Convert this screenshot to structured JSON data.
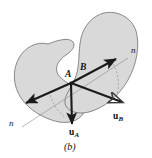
{
  "figure": {
    "caption": "(b)",
    "colors": {
      "body_fill": "#d9d9d9",
      "body_stroke": "#6f6f6f",
      "vector_stroke": "#1a1a1a",
      "normal_line": "#8a8a8a",
      "dashed_arc": "#8a8a8a",
      "background": "#ffffff",
      "label": "#111111"
    },
    "bodies": [
      {
        "name": "body-a",
        "label": "A",
        "label_x": 67,
        "label_y": 74,
        "path": "M 48 44 C 37 41, 25 47, 19 58 C 12 70, 13 86, 21 98 C 29 110, 44 119, 59 122 C 72 124, 82 119, 85 110 C 88 100, 82 92, 74 87 C 66 82, 59 78, 57 72 C 55 65, 60 59, 66 55 C 72 51, 76 46, 73 42 C 69 37, 58 40, 48 44 Z"
      },
      {
        "name": "body-b",
        "label": "B",
        "label_x": 82,
        "label_y": 69,
        "path": "M 104 13 C 92 16, 84 26, 81 38 C 78 52, 80 64, 76 76 C 72 88, 64 95, 65 103 C 66 111, 77 115, 89 112 C 104 108, 119 96, 128 80 C 137 64, 140 45, 136 31 C 132 18, 118 10, 104 13 Z"
      }
    ],
    "contact_point": {
      "x": 71,
      "y": 83
    },
    "normal_line": {
      "name": "common-normal-line",
      "x1": 22,
      "y1": 127,
      "x2": 128,
      "y2": 58,
      "label_left": "n",
      "label_left_x": 12,
      "label_left_y": 124,
      "label_right": "n",
      "label_right_x": 133,
      "label_right_y": 51
    },
    "vectors": [
      {
        "name": "vector-n-upper",
        "label": "n",
        "from_x": 71,
        "from_y": 83,
        "to_x": 119,
        "to_y": 57,
        "label_x": 133,
        "label_y": 51
      },
      {
        "name": "vector-u-a",
        "label": "u",
        "sub": "A",
        "from_x": 71,
        "from_y": 83,
        "to_x": 72,
        "to_y": 128,
        "label_x": 75,
        "label_y": 133
      },
      {
        "name": "vector-u-b",
        "label": "u",
        "sub": "B",
        "from_x": 71,
        "from_y": 83,
        "to_x": 127,
        "to_y": 104,
        "label_x": 117,
        "label_y": 117
      },
      {
        "name": "vector-tangent-left",
        "from_x": 71,
        "from_y": 83,
        "to_x": 24,
        "to_y": 104
      }
    ],
    "arcs": [
      {
        "name": "angle-arc-left",
        "path": "M 50 95 C 53 104, 58 112, 66 118"
      },
      {
        "name": "angle-arc-right",
        "path": "M 113 64 C 119 74, 120 87, 116 98"
      }
    ]
  }
}
